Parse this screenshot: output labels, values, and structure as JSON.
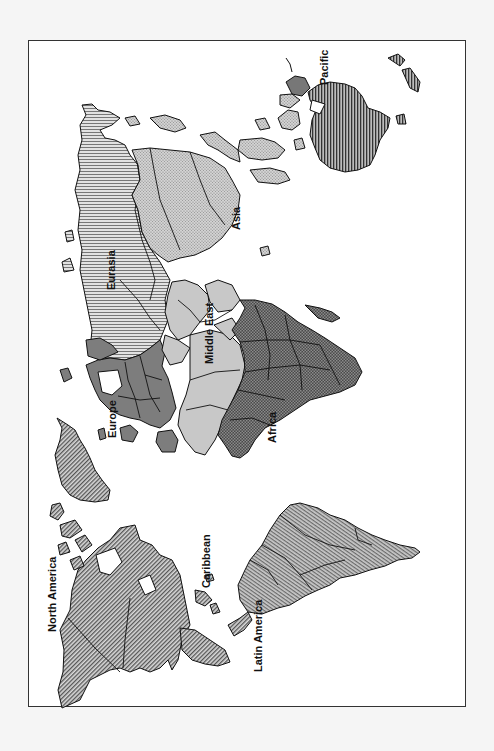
{
  "map": {
    "orientation": "rotated 90 degrees counter-clockwise (north faces left)",
    "regions": [
      {
        "id": "north-america",
        "label": "North America",
        "pattern": "diagonal-hatch",
        "fill": "#9a9a9a"
      },
      {
        "id": "caribbean",
        "label": "Caribbean",
        "pattern": "diagonal-hatch",
        "fill": "#9a9a9a"
      },
      {
        "id": "latin-america",
        "label": "Latin America",
        "pattern": "crosshatch-fine",
        "fill": "#9c9c9c"
      },
      {
        "id": "europe",
        "label": "Europe",
        "pattern": "solid",
        "fill": "#7d7d7d"
      },
      {
        "id": "eurasia",
        "label": "Eurasia",
        "pattern": "horizontal-lines",
        "fill": "#c4c4c4"
      },
      {
        "id": "middle-east",
        "label": "Middle East",
        "pattern": "solid",
        "fill": "#c8c8c8"
      },
      {
        "id": "africa",
        "label": "Africa",
        "pattern": "checker",
        "fill": "#555555"
      },
      {
        "id": "asia",
        "label": "Asia",
        "pattern": "stipple",
        "fill": "#c0c0c0"
      },
      {
        "id": "pacific",
        "label": "Pacific",
        "pattern": "vertical-lines",
        "fill": "#6e6e6e"
      }
    ]
  },
  "labels": {
    "north_america": "North America",
    "caribbean": "Caribbean",
    "latin_america": "Latin America",
    "europe": "Europe",
    "eurasia": "Eurasia",
    "middle_east": "Middle East",
    "africa": "Africa",
    "asia": "Asia",
    "pacific": "Pacific"
  }
}
